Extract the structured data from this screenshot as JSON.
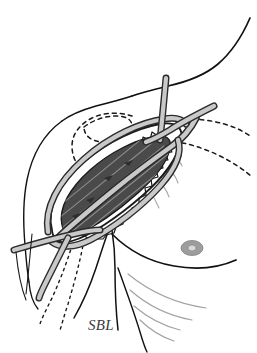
{
  "figure": {
    "type": "medical-surgical-illustration",
    "background_color": "#ffffff",
    "width": 257,
    "height": 353
  },
  "labels": [
    {
      "id": "sbl",
      "text": "SBL",
      "x": 88,
      "y": 330,
      "style": "italic-serif",
      "color": "#3a3a3a"
    }
  ],
  "colors": {
    "outline": "#1a1a1a",
    "body_contour": "#111111",
    "muscle_fill": "#4a4a4a",
    "muscle_striation": "#9a9a9a",
    "subcutaneous_fill": "#ffffff",
    "retractor_band_fill": "#c9c9c9",
    "retractor_band_edge": "#2b2b2b",
    "dashed_marking": "#1a1a1a",
    "skin_fold_line": "#9e9e9e",
    "areola_fill": "#9d9d9d",
    "areola_center": "#d8d8d8",
    "label_color": "#3a3a3a"
  },
  "elements": {
    "body_contours": [
      {
        "name": "neck-shoulder-contour",
        "description": "curve descending from upper right to center left"
      },
      {
        "name": "arm-shoulder-arc",
        "description": "smooth arc forming left arm contour"
      },
      {
        "name": "chest-contour",
        "description": "lower right breast/chest curve"
      },
      {
        "name": "axillary-fold",
        "description": "V-shaped fold descending below wound"
      }
    ],
    "wound": {
      "name": "surgical-incision",
      "orientation": "oblique, lower-left to upper-right",
      "interior": "muscle",
      "edge": "serrated skin margin",
      "striation_count": 9
    },
    "retractor_bands": [
      {
        "name": "band-vertical-upper",
        "path": "descends from top toward wound"
      },
      {
        "name": "band-diagonal-upper-right",
        "path": "enters from right edge toward wound"
      },
      {
        "name": "band-longitudinal",
        "path": "runs along wound long axis"
      },
      {
        "name": "band-horizontal-lower-left",
        "path": "exits toward left edge"
      },
      {
        "name": "band-descending-lower-left",
        "path": "descends to bottom left"
      }
    ],
    "dashed_markings": [
      {
        "name": "dashed-loop-upper-left",
        "description": "closed dashed region above incision"
      },
      {
        "name": "dashed-curve-right-upper",
        "description": "dashed undermining curve to right"
      },
      {
        "name": "dashed-curve-right-lower",
        "description": "second dashed undermining curve"
      },
      {
        "name": "dashed-line-lower-left-a",
        "description": "dotted line descending left"
      },
      {
        "name": "dashed-line-lower-left-b",
        "description": "dotted line descending left"
      }
    ],
    "skin_folds": {
      "name": "inframammary-fold-lines",
      "count": 4,
      "description": "light gray fan curves lower right"
    },
    "areola": {
      "name": "areola-marker",
      "cx": 192,
      "cy": 248,
      "rx": 11,
      "ry": 7.5
    }
  }
}
